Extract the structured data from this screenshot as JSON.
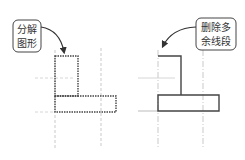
{
  "diagram": {
    "left_panel": {
      "callout": {
        "line1": "分解",
        "line2": "图形"
      },
      "shape_style": "dotted"
    },
    "right_panel": {
      "callout": {
        "line1": "删除多",
        "line2": "余线段"
      },
      "shape_style": "solid"
    },
    "colors": {
      "outline": "#444444",
      "guide": "#bbbbbb",
      "callout_border": "#444444",
      "text": "#333333",
      "background": "#ffffff"
    }
  }
}
